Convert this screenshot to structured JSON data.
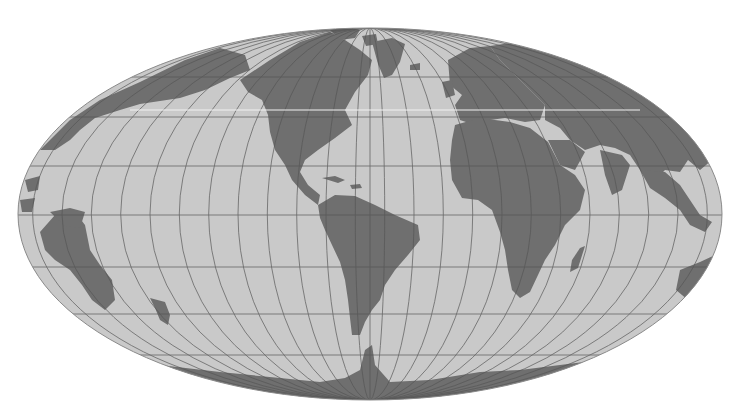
{
  "map": {
    "type": "world-map",
    "projection": "equal-area ellipse (Mollweide/Hammer-like), oblique grid",
    "colors": {
      "background": "#ffffff",
      "ocean": "#c9c9c9",
      "land": "#6f6f6f",
      "graticule": "#555555"
    },
    "extent": {
      "cx": 370,
      "cy": 214,
      "rx": 352,
      "ry": 186
    },
    "parallels_y": [
      77,
      117,
      166,
      215,
      267,
      314,
      355
    ],
    "meridian_count": 24,
    "regions_visible": [
      "North America",
      "South America",
      "Greenland",
      "Europe",
      "Africa",
      "Asia",
      "Madagascar",
      "Antarctica",
      "Australia-region islands",
      "Pacific islands",
      "Indonesia"
    ]
  }
}
